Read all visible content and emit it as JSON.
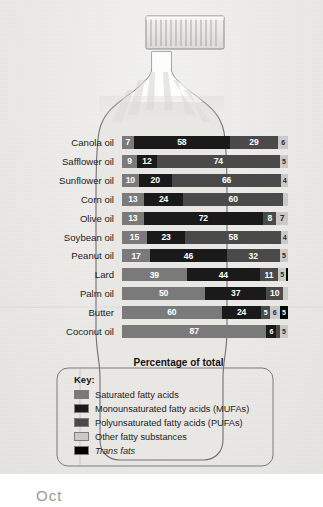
{
  "axis_title": "Percentage of total",
  "legend": {
    "title": "Key:",
    "items": [
      {
        "label": "Saturated fatty acids",
        "color": "#7a7a7a",
        "key": "sat"
      },
      {
        "label": "Monounsaturated fatty acids (MUFAs)",
        "color": "#1a1a1a",
        "key": "mufa"
      },
      {
        "label": "Polyunsaturated fatty acids (PUFAs)",
        "color": "#4a4a4a",
        "key": "pufa"
      },
      {
        "label": "Other fatty substances",
        "color": "#c9c9c9",
        "key": "other"
      },
      {
        "label": "Trans fats",
        "color": "#000000",
        "key": "trans"
      }
    ]
  },
  "colors": {
    "saturated": "#7a7a7a",
    "mufa": "#1a1a1a",
    "pufa": "#4a4a4a",
    "other": "#c9c9c9",
    "trans": "#000000",
    "bottle_fill": "#e9e7e4",
    "bottle_line": "#6f6f6f",
    "page_bg": "#eceae7"
  },
  "bottom_fragment": "Oct",
  "chart_data": {
    "type": "bar",
    "orientation": "horizontal",
    "stacked": true,
    "title": "",
    "xlabel": "Percentage of total",
    "ylabel": "",
    "xlim": [
      0,
      100
    ],
    "grid": false,
    "legend_position": "bottom",
    "categories": [
      "Canola oil",
      "Safflower oil",
      "Sunflower oil",
      "Corn oil",
      "Olive oil",
      "Soybean oil",
      "Peanut oil",
      "Lard",
      "Palm oil",
      "Butter",
      "Coconut oil"
    ],
    "series": [
      {
        "name": "Saturated fatty acids",
        "key": "sat",
        "values": [
          7,
          9,
          10,
          13,
          13,
          15,
          17,
          39,
          50,
          60,
          87
        ]
      },
      {
        "name": "Monounsaturated fatty acids (MUFAs)",
        "key": "mufa",
        "values": [
          58,
          12,
          20,
          24,
          72,
          23,
          46,
          44,
          37,
          24,
          6
        ]
      },
      {
        "name": "Polyunsaturated fatty acids (PUFAs)",
        "key": "pufa",
        "values": [
          29,
          74,
          66,
          60,
          8,
          58,
          32,
          11,
          10,
          5,
          2
        ]
      },
      {
        "name": "Other fatty substances",
        "key": "other",
        "values": [
          6,
          5,
          4,
          3,
          7,
          4,
          5,
          5,
          3,
          6,
          5
        ]
      },
      {
        "name": "Trans fats",
        "key": "trans",
        "values": [
          0,
          0,
          0,
          0,
          0,
          0,
          0,
          1,
          0,
          5,
          0
        ]
      }
    ],
    "bars": [
      {
        "category": "Canola oil",
        "segments": [
          {
            "key": "sat",
            "value": 7
          },
          {
            "key": "mufa",
            "value": 58
          },
          {
            "key": "pufa",
            "value": 29
          },
          {
            "key": "other",
            "value": 6
          }
        ]
      },
      {
        "category": "Safflower oil",
        "segments": [
          {
            "key": "sat",
            "value": 9
          },
          {
            "key": "mufa",
            "value": 12
          },
          {
            "key": "pufa",
            "value": 74
          },
          {
            "key": "other",
            "value": 5
          }
        ]
      },
      {
        "category": "Sunflower oil",
        "segments": [
          {
            "key": "sat",
            "value": 10
          },
          {
            "key": "mufa",
            "value": 20
          },
          {
            "key": "pufa",
            "value": 66
          },
          {
            "key": "other",
            "value": 4
          }
        ]
      },
      {
        "category": "Corn oil",
        "segments": [
          {
            "key": "sat",
            "value": 13
          },
          {
            "key": "mufa",
            "value": 24
          },
          {
            "key": "pufa",
            "value": 60
          },
          {
            "key": "other",
            "value": 3
          }
        ]
      },
      {
        "category": "Olive oil",
        "segments": [
          {
            "key": "sat",
            "value": 13
          },
          {
            "key": "mufa",
            "value": 72
          },
          {
            "key": "pufa",
            "value": 8
          },
          {
            "key": "other",
            "value": 7
          }
        ]
      },
      {
        "category": "Soybean oil",
        "segments": [
          {
            "key": "sat",
            "value": 15
          },
          {
            "key": "mufa",
            "value": 23
          },
          {
            "key": "pufa",
            "value": 58
          },
          {
            "key": "other",
            "value": 4
          }
        ]
      },
      {
        "category": "Peanut oil",
        "segments": [
          {
            "key": "sat",
            "value": 17
          },
          {
            "key": "mufa",
            "value": 46
          },
          {
            "key": "pufa",
            "value": 32
          },
          {
            "key": "other",
            "value": 5
          }
        ]
      },
      {
        "category": "Lard",
        "segments": [
          {
            "key": "sat",
            "value": 39
          },
          {
            "key": "mufa",
            "value": 44
          },
          {
            "key": "pufa",
            "value": 11
          },
          {
            "key": "other",
            "value": 5
          },
          {
            "key": "trans",
            "value": 1
          }
        ]
      },
      {
        "category": "Palm oil",
        "segments": [
          {
            "key": "sat",
            "value": 50
          },
          {
            "key": "mufa",
            "value": 37
          },
          {
            "key": "pufa",
            "value": 10
          },
          {
            "key": "other",
            "value": 3
          }
        ]
      },
      {
        "category": "Butter",
        "segments": [
          {
            "key": "sat",
            "value": 60
          },
          {
            "key": "mufa",
            "value": 24
          },
          {
            "key": "pufa",
            "value": 5
          },
          {
            "key": "other",
            "value": 6
          },
          {
            "key": "trans",
            "value": 5
          }
        ]
      },
      {
        "category": "Coconut oil",
        "segments": [
          {
            "key": "sat",
            "value": 87
          },
          {
            "key": "mufa",
            "value": 6
          },
          {
            "key": "pufa",
            "value": 2
          },
          {
            "key": "other",
            "value": 5
          }
        ]
      }
    ]
  }
}
